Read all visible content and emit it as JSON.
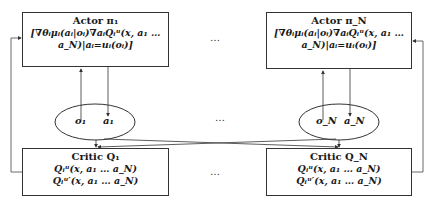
{
  "actors": [
    {
      "title": "Actor π₁",
      "gradient_line1": "[∇θᵢμᵢ(aᵢ|oᵢ)∇aᵢQᵢᵘ(x, a₁ …",
      "gradient_line2": "a_N)|aᵢ=uᵢ(oᵢ)]"
    },
    {
      "title": "Actor π_N",
      "gradient_line1": "[∇θᵢμᵢ(aᵢ|oᵢ)∇aᵢQᵢᵘ(x, a₁ …",
      "gradient_line2": "a_N)|aᵢ=uᵢ(oᵢ)]"
    }
  ],
  "agents": [
    {
      "observation": "o₁",
      "action": "a₁"
    },
    {
      "observation": "o_N",
      "action": "a_N"
    }
  ],
  "critics": [
    {
      "title": "Critic Q₁",
      "line1": "Qᵢᵘ(x, a₁ … a_N)",
      "line2": "Qᵢᵘ′(x, a₁ … a_N)"
    },
    {
      "title": "Critic Q_N",
      "line1": "Qᵢᵘ(x, a₁ … a_N)",
      "line2": "Qᵢᵘ′(x, a₁ … a_N)"
    }
  ],
  "ellipsis": "…",
  "colors": {
    "line": "#333333",
    "box_border": "#333333",
    "text": "#1a1a1a"
  }
}
